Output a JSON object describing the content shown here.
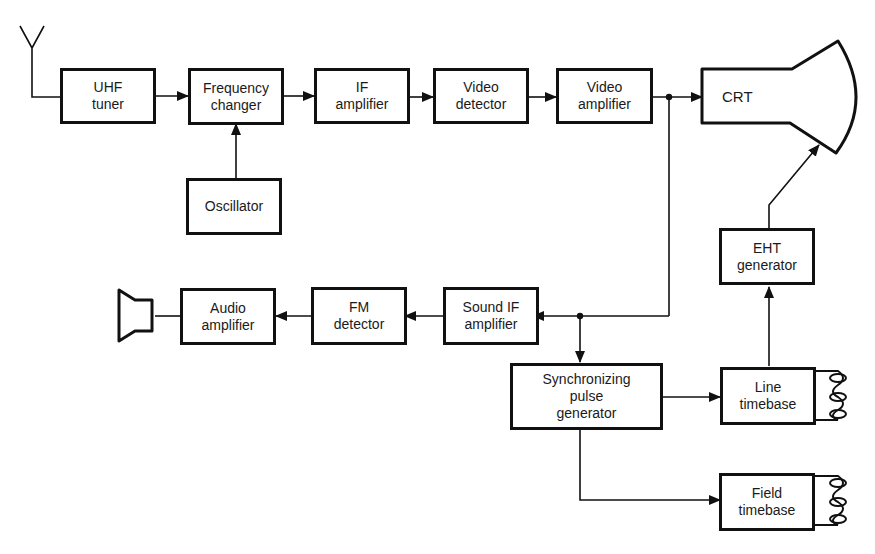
{
  "blocks": {
    "uhf_tuner": "UHF\ntuner",
    "frequency_changer": "Frequency\nchanger",
    "oscillator": "Oscillator",
    "if_amplifier": "IF\namplifier",
    "video_detector": "Video\ndetector",
    "video_amplifier": "Video\namplifier",
    "crt": "CRT",
    "eht_generator": "EHT\ngenerator",
    "sound_if_amplifier": "Sound IF\namplifier",
    "fm_detector": "FM\ndetector",
    "audio_amplifier": "Audio\namplifier",
    "sync_pulse_generator": "Synchronizing\npulse\ngenerator",
    "line_timebase": "Line\ntimebase",
    "field_timebase": "Field\ntimebase"
  },
  "symbols": {
    "antenna": "antenna-icon",
    "loudspeaker": "loudspeaker-icon",
    "line_coil": "deflection-coil-icon",
    "field_coil": "deflection-coil-icon"
  },
  "colors": {
    "stroke": "#111111",
    "background": "#ffffff"
  }
}
